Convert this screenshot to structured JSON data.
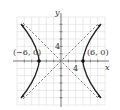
{
  "diagram": {
    "type": "hyperbola-graph",
    "equation_hint": "x^2/36 - y^2/36 = 1",
    "axes": {
      "x_label": "x",
      "y_label": "y",
      "x_tick_label": "4",
      "y_tick_label": "4",
      "grid_step": 2,
      "range": [
        -12,
        12
      ]
    },
    "vertices": [
      {
        "label": "(−6, 0)",
        "x": -6,
        "y": 0
      },
      {
        "label": "(6, 0)",
        "x": 6,
        "y": 0
      }
    ],
    "asymptotes": [
      "y = x",
      "y = -x"
    ],
    "colors": {
      "grid": "#d9d9d9",
      "axis": "#555555",
      "curve": "#222222",
      "asymptote": "#666666"
    }
  }
}
